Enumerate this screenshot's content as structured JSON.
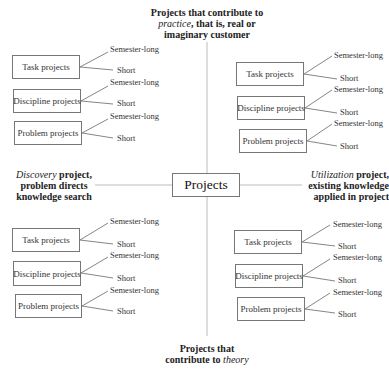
{
  "center": {
    "label": "Projects"
  },
  "captions": {
    "top": {
      "line1": "Projects that contribute to",
      "line2_italic": "practice",
      "line2_rest": ", that is, real or",
      "line3": "imaginary customer"
    },
    "left": {
      "line1_italic": "Discovery",
      "line1_rest": " project,",
      "line2": "problem directs",
      "line3": "knowledge search"
    },
    "right": {
      "line1_italic": "Utilization",
      "line1_rest": " project,",
      "line2": "existing knowledge",
      "line3": "applied in project"
    },
    "bottom": {
      "line1": "Projects that",
      "line2_rest": "contribute to ",
      "line2_italic": "theory"
    }
  },
  "quadrants": {
    "top_left": [
      {
        "label": "Task projects",
        "branches": [
          "Semester-long",
          "Short"
        ]
      },
      {
        "label": "Discipline projects",
        "branches": [
          "Semester-long",
          "Short"
        ]
      },
      {
        "label": "Problem projects",
        "branches": [
          "Semester-long",
          "Short"
        ]
      }
    ],
    "top_right": [
      {
        "label": "Task projects",
        "branches": [
          "Semester-long",
          "Short"
        ]
      },
      {
        "label": "Discipline projects",
        "branches": [
          "Semester-long",
          "Short"
        ]
      },
      {
        "label": "Problem projects",
        "branches": [
          "Semester-long",
          "Short"
        ]
      }
    ],
    "bottom_left": [
      {
        "label": "Task projects",
        "branches": [
          "Semester-long",
          "Short"
        ]
      },
      {
        "label": "Discipline projects",
        "branches": [
          "Semester-long",
          "Short"
        ]
      },
      {
        "label": "Problem projects",
        "branches": [
          "Semester-long",
          "Short"
        ]
      }
    ],
    "bottom_right": [
      {
        "label": "Task projects",
        "branches": [
          "Semester-long",
          "Short"
        ]
      },
      {
        "label": "Discipline projects",
        "branches": [
          "Semester-long",
          "Short"
        ]
      },
      {
        "label": "Problem projects",
        "branches": [
          "Semester-long",
          "Short"
        ]
      }
    ]
  }
}
